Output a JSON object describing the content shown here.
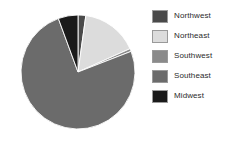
{
  "chart_data": {
    "type": "pie",
    "title": "",
    "categories": [
      "Northwest",
      "Northeast",
      "Southwest",
      "Southeast",
      "Midwest"
    ],
    "values": [
      2.2,
      16.1,
      0.8,
      75.3,
      5.6
    ],
    "units": "percent",
    "start_angle_deg": 0,
    "direction": "clockwise",
    "legend_position": "right",
    "grid": false,
    "colors": [
      "#4a4a4a",
      "#dcdcdc",
      "#8a8a8a",
      "#6b6b6b",
      "#1a1a1a"
    ],
    "slice_border_color": "#ffffff",
    "background": "#ffffff"
  },
  "legend": {
    "items": [
      {
        "label": "Northwest",
        "color": "#4a4a4a"
      },
      {
        "label": "Northeast",
        "color": "#dcdcdc"
      },
      {
        "label": "Southwest",
        "color": "#8a8a8a"
      },
      {
        "label": "Southeast",
        "color": "#6b6b6b"
      },
      {
        "label": "Midwest",
        "color": "#1a1a1a"
      }
    ]
  }
}
